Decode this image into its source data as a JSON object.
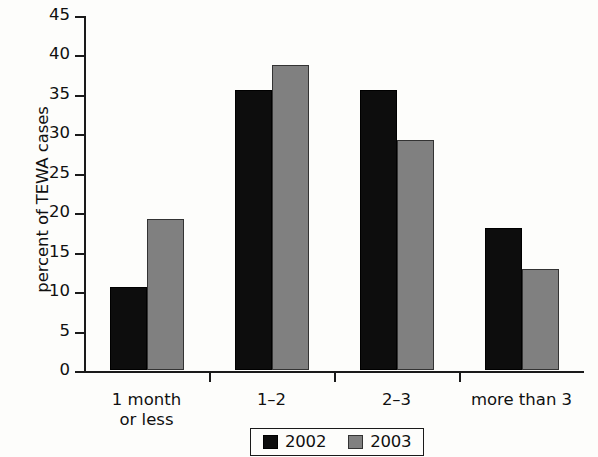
{
  "chart_data": {
    "type": "bar",
    "title": "",
    "subtitle": "",
    "xlabel": "",
    "ylabel": "percent of TEWA cases",
    "categories": [
      "1 month\nor less",
      "1–2",
      "2–3",
      "more than 3"
    ],
    "series": [
      {
        "name": "2002",
        "color": "#0d0d0d",
        "values": [
          10.5,
          35.5,
          35.5,
          18.0
        ]
      },
      {
        "name": "2003",
        "color": "#808080",
        "values": [
          19.2,
          38.7,
          29.2,
          12.8
        ]
      }
    ],
    "ylim": [
      0,
      45
    ],
    "yticks": [
      0,
      5,
      10,
      15,
      20,
      25,
      30,
      35,
      40,
      45
    ],
    "ytick_labels": [
      "0",
      "5",
      "10",
      "15",
      "20",
      "25",
      "30",
      "35",
      "40",
      "45"
    ],
    "grid": false,
    "legend_position": "bottom-center",
    "legend_entries": [
      "2002",
      "2003"
    ]
  }
}
